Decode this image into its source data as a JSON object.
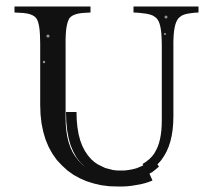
{
  "image": {
    "kind": "scanned-letterform",
    "character": "U",
    "character_case": "uppercase",
    "typeface_style": "serif",
    "width": 208,
    "height": 196,
    "background_color": "#ffffff",
    "ink_color": "#111111",
    "description": "Uppercase serif letter U rendered in black ink on a white background"
  },
  "glyph": {
    "label": "U",
    "left_stem": {
      "x_start": 37,
      "x_end": 65,
      "width": 28,
      "weight": "thick"
    },
    "right_stem": {
      "x_start": 160,
      "x_end": 172,
      "width": 12,
      "weight": "thin"
    },
    "left_serif": {
      "x_start": 14,
      "x_end": 90,
      "y_top": 6,
      "thickness": 6
    },
    "right_serif": {
      "x_start": 133,
      "x_end": 198,
      "y_top": 6,
      "thickness": 6
    },
    "bowl": {
      "outer_bottom_y": 181,
      "inner_bottom_y": 160,
      "counter_x_start": 65,
      "counter_x_end": 160
    },
    "cap_height_top": 6,
    "baseline": 181
  },
  "artifacts": {
    "speck_count": 4,
    "note": "faint scan specks inside the ink area"
  }
}
